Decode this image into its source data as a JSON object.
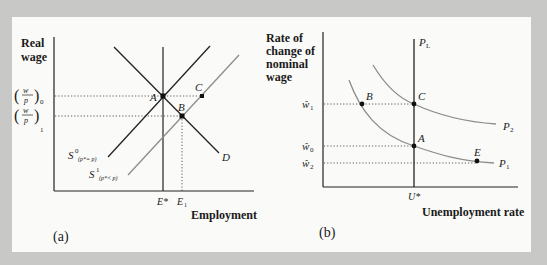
{
  "colors": {
    "background": "#c8c8c6",
    "panel": "#fafaf8",
    "dark_line": "#222222",
    "grey_line": "#8c8c8c"
  },
  "panel_a": {
    "caption": "(a)",
    "y_axis_label_lines": [
      "Real",
      "wage"
    ],
    "x_axis_label": "Employment",
    "y_ticks": [
      {
        "label": "(w/p)",
        "sub": "0"
      },
      {
        "label": "(w/p)",
        "sub": "1"
      }
    ],
    "x_ticks": [
      {
        "label": "E*"
      },
      {
        "label": "E",
        "sub": "1"
      }
    ],
    "curves": {
      "s0": {
        "label": "S",
        "sup": "0",
        "sub": "(p*= p)"
      },
      "s1": {
        "label": "S",
        "sup": "1",
        "sub": "(p*< p)"
      },
      "d": {
        "label": "D"
      }
    },
    "points": {
      "a": "A",
      "b": "B",
      "c": "C"
    }
  },
  "panel_b": {
    "caption": "(b)",
    "y_axis_label_lines": [
      "Rate of",
      "change of",
      "nominal",
      "wage"
    ],
    "x_axis_label": "Unemployment rate",
    "y_ticks": [
      {
        "label": "ŵ",
        "sub": "1"
      },
      {
        "label": "ŵ",
        "sub": "0"
      },
      {
        "label": "ŵ",
        "sub": "2"
      }
    ],
    "x_ticks": [
      {
        "label": "U*"
      }
    ],
    "curves": {
      "pl": {
        "label": "P",
        "sub": "L"
      },
      "p1": {
        "label": "P",
        "sub": "1"
      },
      "p2": {
        "label": "P",
        "sub": "2"
      }
    },
    "points": {
      "a": "A",
      "b": "B",
      "c": "C",
      "e": "E"
    }
  }
}
